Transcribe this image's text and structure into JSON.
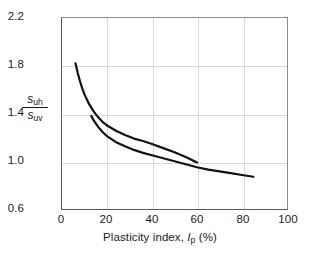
{
  "chart_data": {
    "type": "line",
    "title": "",
    "xlabel_parts": {
      "text_before": "Plasticity index, ",
      "symbol": "I",
      "subscript": "p",
      "text_after": " (%)"
    },
    "xlabel": "Plasticity index, Ip (%)",
    "ylabel_parts": {
      "numerator_symbol": "s",
      "numerator_subscript": "uh",
      "denominator_symbol": "s",
      "denominator_subscript": "uv"
    },
    "ylabel": "suh / suv",
    "xlim": [
      0,
      100
    ],
    "ylim": [
      0.6,
      2.2
    ],
    "xticks": [
      "0",
      "20",
      "40",
      "60",
      "80",
      "100"
    ],
    "xtick_values": [
      0,
      20,
      40,
      60,
      80,
      100
    ],
    "yticks": [
      "0.6",
      "1.0",
      "1.4",
      "1.8",
      "2.2"
    ],
    "ytick_values": [
      0.6,
      1.0,
      1.4,
      1.8,
      2.2
    ],
    "grid": true,
    "grid_color": "#d9d9d9",
    "legend": "none",
    "line_color": "#111111",
    "line_width": 2.2,
    "series": [
      {
        "name": "upper-curve",
        "x": [
          6,
          7,
          8,
          9,
          10,
          12,
          14,
          16,
          18,
          20,
          24,
          28,
          32,
          36,
          40,
          45,
          50,
          55,
          60
        ],
        "values": [
          1.82,
          1.74,
          1.67,
          1.61,
          1.56,
          1.48,
          1.42,
          1.37,
          1.33,
          1.3,
          1.255,
          1.22,
          1.19,
          1.17,
          1.145,
          1.11,
          1.075,
          1.035,
          0.99
        ]
      },
      {
        "name": "lower-curve",
        "x": [
          13,
          14,
          16,
          18,
          20,
          24,
          28,
          32,
          36,
          40,
          45,
          50,
          55,
          60,
          65,
          70,
          75,
          80,
          85
        ],
        "values": [
          1.38,
          1.345,
          1.29,
          1.245,
          1.21,
          1.16,
          1.125,
          1.095,
          1.07,
          1.05,
          1.025,
          1.0,
          0.975,
          0.95,
          0.93,
          0.915,
          0.9,
          0.885,
          0.87
        ]
      }
    ]
  },
  "axes": {
    "frame_color": "#5a5a5a"
  }
}
